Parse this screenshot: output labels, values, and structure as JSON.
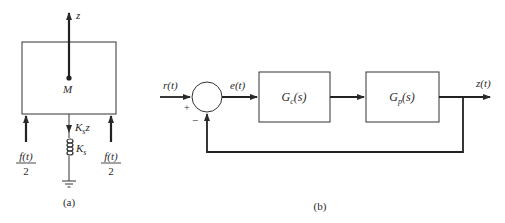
{
  "figure_a": {
    "caption": "(a)",
    "z_label": "z",
    "mass_label": "M",
    "spring_force_label": "K",
    "spring_force_sub": "s",
    "spring_force_var": "z",
    "spring_label": "K",
    "spring_sub": "s",
    "left_force_num": "f(t)",
    "left_force_den": "2",
    "right_force_num": "f(t)",
    "right_force_den": "2"
  },
  "figure_b": {
    "caption": "(b)",
    "input_label": "r(t)",
    "error_label": "e(t)",
    "output_label": "z(t)",
    "plus_sign": "+",
    "minus_sign": "−",
    "controller_label": "G",
    "controller_sub": "c",
    "controller_arg": "(s)",
    "plant_label": "G",
    "plant_sub": "p",
    "plant_arg": "(s)"
  }
}
